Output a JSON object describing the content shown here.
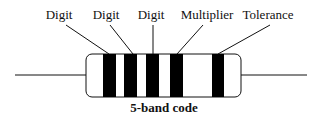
{
  "diagram": {
    "caption": "5-band code",
    "labels": [
      {
        "text": "Digit",
        "x": 59,
        "y": 19
      },
      {
        "text": "Digit",
        "x": 106,
        "y": 19
      },
      {
        "text": "Digit",
        "x": 151,
        "y": 19
      },
      {
        "text": "Multiplier",
        "x": 207,
        "y": 19
      },
      {
        "text": "Tolerance",
        "x": 268,
        "y": 19
      }
    ],
    "bands": [
      {
        "name": "digit-1",
        "x": 103,
        "w": 13
      },
      {
        "name": "digit-2",
        "x": 124,
        "w": 13
      },
      {
        "name": "digit-3",
        "x": 146,
        "w": 13
      },
      {
        "name": "multiplier",
        "x": 170,
        "w": 13
      },
      {
        "name": "tolerance",
        "x": 212,
        "w": 12
      }
    ],
    "band_color": "#000000",
    "body_color": "#ffffff",
    "line_color": "#111111"
  }
}
